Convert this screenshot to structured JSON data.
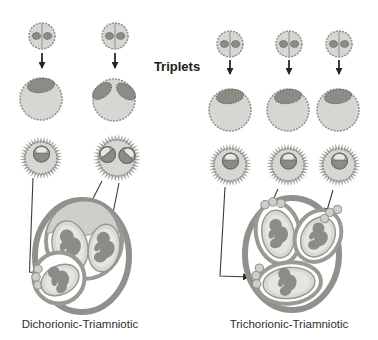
{
  "title": "Triplets",
  "panels": [
    {
      "id": "dichorionic",
      "label": "Dichorionic-Triamniotic",
      "zygotes": 2,
      "blastocysts": [
        {
          "inner_cell_masses": 1
        },
        {
          "inner_cell_masses": 2
        }
      ],
      "chorionic_vesicles": [
        {
          "embryos": 1
        },
        {
          "embryos": 2
        }
      ],
      "uterus": {
        "chorions": 2,
        "amniotic_sacs": 3,
        "fetuses": 3
      }
    },
    {
      "id": "trichorionic",
      "label": "Trichorionic-Triamniotic",
      "zygotes": 3,
      "blastocysts": [
        {
          "inner_cell_masses": 1
        },
        {
          "inner_cell_masses": 1
        },
        {
          "inner_cell_masses": 1
        }
      ],
      "chorionic_vesicles": [
        {
          "embryos": 1
        },
        {
          "embryos": 1
        },
        {
          "embryos": 1
        }
      ],
      "uterus": {
        "chorions": 3,
        "amniotic_sacs": 3,
        "fetuses": 3
      }
    }
  ],
  "colors": {
    "cell": "#d6d6d2",
    "cellEdge": "#8f9089",
    "mass": "#8b8c86",
    "massEdge": "#65665f",
    "spike": "#a6a8a0",
    "ring": "#8d928b",
    "chorion": "#969b94",
    "placenta": "#cfcfca",
    "amnion": "#d9d9d4",
    "amnionInner": "#e6e6e1",
    "amnionEdge": "#95968f",
    "line": "#3c3c38",
    "arrow": "#1c1c1a",
    "text": "#2f2f2b"
  }
}
